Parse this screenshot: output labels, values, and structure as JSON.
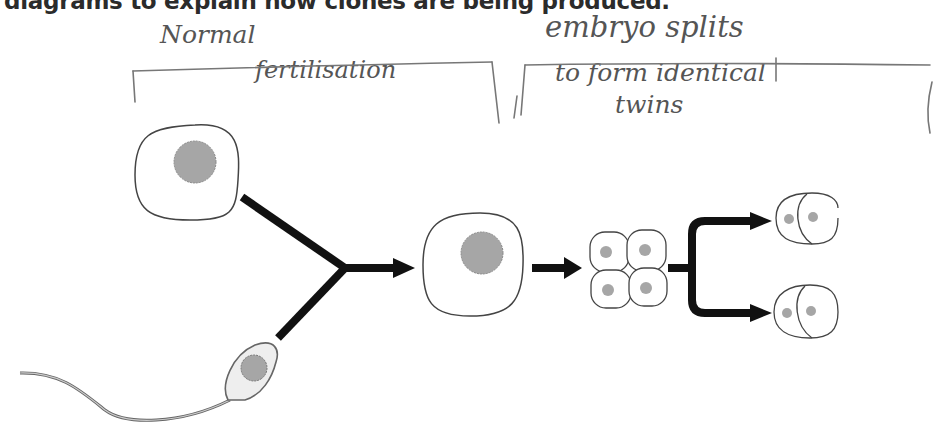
{
  "question": {
    "text": "diagrams to explain how clones are being produced."
  },
  "annotations": {
    "normal": "Normal",
    "fertilisation": "fertilisation",
    "embryo_splits": "embryo splits",
    "to_form_identical": "to form identical",
    "twins": "twins"
  },
  "diagram": {
    "stages": [
      {
        "id": "egg-cell",
        "label": "egg cell with nucleus"
      },
      {
        "id": "sperm-cell",
        "label": "sperm cell"
      },
      {
        "id": "zygote",
        "label": "fertilised egg"
      },
      {
        "id": "four-cell-embryo",
        "label": "4-cell embryo"
      },
      {
        "id": "twin-embryo-1",
        "label": "2-cell embryo (twin 1)"
      },
      {
        "id": "twin-embryo-2",
        "label": "2-cell embryo (twin 2)"
      }
    ],
    "colors": {
      "outline": "#555555",
      "nucleus": "#a6a6a6",
      "arrow": "#111111",
      "handwriting": "#555555"
    }
  }
}
